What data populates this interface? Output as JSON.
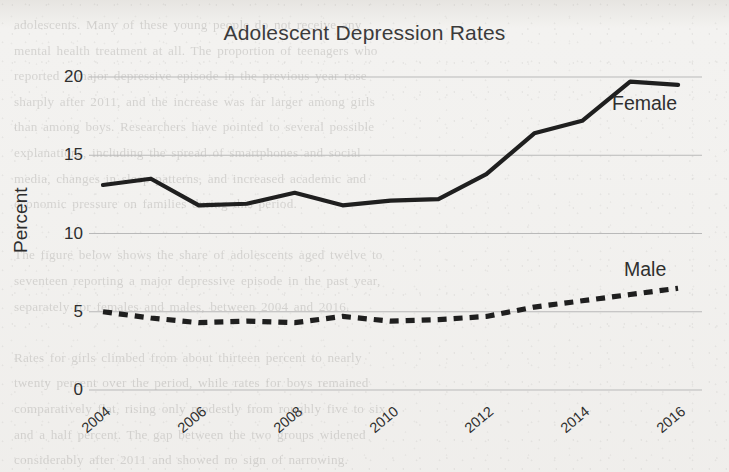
{
  "page": {
    "background_color": "#f3f2f0",
    "ghost_text_lines": [
      "adolescents. Many of these young people do not receive any",
      "mental health treatment at all. The proportion of teenagers who",
      "reported a major depressive episode in the previous year rose",
      "sharply after 2011, and the increase was far larger among girls",
      "than among boys. Researchers have pointed to several possible",
      "explanations, including the spread of smartphones and social",
      "media, changes in sleep patterns, and increased academic and",
      "economic pressure on families during this period.",
      "",
      "The figure below shows the share of adolescents aged twelve to",
      "seventeen reporting a major depressive episode in the past year,",
      "separately for females and males, between 2004 and 2016.",
      "",
      "Rates for girls climbed from about thirteen percent to nearly",
      "twenty percent over the period, while rates for boys remained",
      "comparatively flat, rising only modestly from roughly five to six",
      "and a half percent. The gap between the two groups widened",
      "considerably after 2011 and showed no sign of narrowing."
    ]
  },
  "chart_data": {
    "type": "line",
    "title": "Adolescent Depression Rates",
    "xlabel": "",
    "ylabel": "Percent",
    "ylim": [
      0,
      20
    ],
    "xlim": [
      2004,
      2016.5
    ],
    "yticks": [
      "20",
      "15",
      "10",
      "5",
      "0"
    ],
    "ytick_values": [
      20,
      15,
      10,
      5,
      0
    ],
    "xticks": [
      "2004",
      "2006",
      "2008",
      "2010",
      "2012",
      "2014",
      "2016"
    ],
    "xtick_values": [
      2004,
      2006,
      2008,
      2010,
      2012,
      2014,
      2016
    ],
    "grid": true,
    "grid_axis": "y",
    "grid_color": "#b9b9b9",
    "legend": "inline-labels",
    "line_color": "#1f1f1f",
    "x": [
      2004,
      2005,
      2006,
      2007,
      2008,
      2009,
      2010,
      2011,
      2012,
      2013,
      2014,
      2015,
      2016
    ],
    "series": [
      {
        "name": "Female",
        "style": "solid",
        "color": "#1f1f1f",
        "values": [
          13.1,
          13.5,
          11.8,
          11.9,
          12.6,
          11.8,
          12.1,
          12.2,
          13.8,
          16.4,
          17.2,
          19.7,
          19.5
        ]
      },
      {
        "name": "Male",
        "style": "dashed",
        "color": "#1f1f1f",
        "values": [
          5.0,
          4.6,
          4.3,
          4.4,
          4.3,
          4.7,
          4.4,
          4.5,
          4.7,
          5.3,
          5.7,
          6.1,
          6.5
        ]
      }
    ],
    "annotations": [
      {
        "text": "Female",
        "series": "Female"
      },
      {
        "text": "Male",
        "series": "Male"
      }
    ]
  }
}
